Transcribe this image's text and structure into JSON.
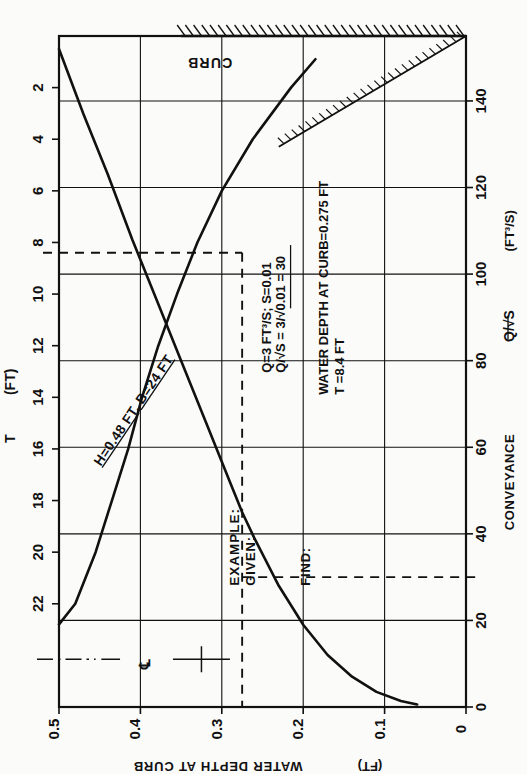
{
  "figure": {
    "kind": "engineering-nomograph",
    "orientation": "rotated-90-ccw",
    "curb_label": "CURB",
    "centerline_symbol": "℄"
  },
  "axes": {
    "depth": {
      "label": "WATER DEPTH AT CURB",
      "units": "(FT)",
      "ticks": [
        "0.5",
        "0.4",
        "0.3",
        "0.2",
        "0.1",
        "0"
      ],
      "values": [
        0.5,
        0.4,
        0.3,
        0.2,
        0.1,
        0.0
      ],
      "min": 0.0,
      "max": 0.5
    },
    "spread": {
      "label": "T",
      "units": "(FT)",
      "ticks": [
        "2",
        "4",
        "6",
        "8",
        "10",
        "12",
        "14",
        "16",
        "18",
        "20",
        "22"
      ],
      "values": [
        2,
        4,
        6,
        8,
        10,
        12,
        14,
        16,
        18,
        20,
        22
      ],
      "min": 0,
      "max": 26
    },
    "conveyance": {
      "label": "CONVEYANCE",
      "symbol": "Q/√S",
      "units": "(FT³/S)",
      "ticks": [
        "0",
        "20",
        "40",
        "60",
        "80",
        "100",
        "120",
        "140"
      ],
      "values": [
        0,
        20,
        40,
        60,
        80,
        100,
        120,
        140
      ],
      "min": 0,
      "max": 155
    }
  },
  "curves": {
    "spread_curve": {
      "name": "T vs water depth at curb",
      "annotation": "H=0.48 FT, B=24 FT",
      "points": [
        [
          0.5,
          22.8
        ],
        [
          0.48,
          22.0
        ],
        [
          0.455,
          20.0
        ],
        [
          0.435,
          18.0
        ],
        [
          0.415,
          16.0
        ],
        [
          0.398,
          14.0
        ],
        [
          0.378,
          12.0
        ],
        [
          0.355,
          10.0
        ],
        [
          0.33,
          8.0
        ],
        [
          0.3,
          6.0
        ],
        [
          0.262,
          4.0
        ],
        [
          0.215,
          2.0
        ],
        [
          0.185,
          0.9
        ]
      ]
    },
    "conveyance_curve": {
      "name": "Conveyance vs water depth at curb",
      "points": [
        [
          0.5,
          152
        ],
        [
          0.47,
          137
        ],
        [
          0.44,
          123
        ],
        [
          0.41,
          108
        ],
        [
          0.38,
          94
        ],
        [
          0.35,
          80
        ],
        [
          0.32,
          66
        ],
        [
          0.29,
          52
        ],
        [
          0.275,
          45
        ],
        [
          0.26,
          39
        ],
        [
          0.23,
          28
        ],
        [
          0.2,
          19
        ],
        [
          0.17,
          12
        ],
        [
          0.14,
          7
        ],
        [
          0.11,
          3.5
        ],
        [
          0.08,
          1.4
        ],
        [
          0.06,
          0.6
        ]
      ]
    }
  },
  "example": {
    "heading": "EXAMPLE:",
    "given_heading": "GIVEN:",
    "given_lines": [
      "Q=3 FT³/S;  S=0.01",
      "Q/√S = 3/√0.01 = 30"
    ],
    "find_heading": "FIND:",
    "find_lines": [
      "WATER DEPTH AT CURB=0.275 FT",
      "T =8.4 FT"
    ],
    "construction": {
      "depth": 0.275,
      "spread_T": 8.4,
      "conveyance": 30
    }
  },
  "colors": {
    "ink": "#111111",
    "grid": "#1a1a1a",
    "paper": "#fbfbfa"
  }
}
